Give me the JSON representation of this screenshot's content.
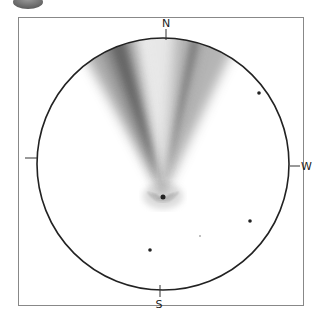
{
  "diagram": {
    "type": "comet sky chart",
    "compass": {
      "north": "N",
      "south": "S",
      "west": "W",
      "east": ""
    },
    "colors": {
      "frame": "#777777",
      "circle": "#222222",
      "tail": "#555555",
      "badge": "#7a7a7a"
    }
  }
}
